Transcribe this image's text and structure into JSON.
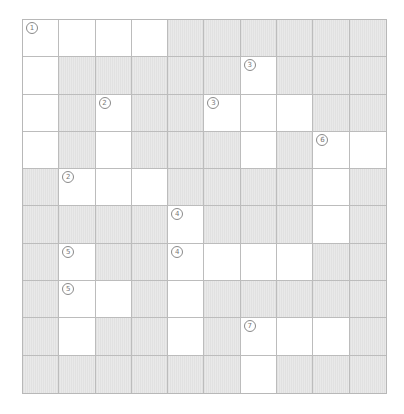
{
  "puzzle": {
    "type": "crossword-grid",
    "rows": 10,
    "cols": 10,
    "colors": {
      "open": "#ffffff",
      "blocked": "#e9e9e9",
      "line": "#bcbcbc",
      "number": "#777777"
    },
    "layout": [
      "WWWWGGGGGG",
      "WGGGGGWGGG",
      "WGWGGWWWGG",
      "WGWGGGWGWW",
      "GWWWGGGGWG",
      "GGGGWGGGWG",
      "GWGGWWWWGG",
      "GWWGWGGGGG",
      "GWGGWGWWWG",
      "GGGGGGWGGG"
    ],
    "clue_numbers": [
      {
        "row": 0,
        "col": 0,
        "label": "①"
      },
      {
        "row": 1,
        "col": 6,
        "label": "③"
      },
      {
        "row": 2,
        "col": 2,
        "label": "②"
      },
      {
        "row": 2,
        "col": 5,
        "label": "③"
      },
      {
        "row": 3,
        "col": 8,
        "label": "⑥"
      },
      {
        "row": 4,
        "col": 1,
        "label": "②"
      },
      {
        "row": 5,
        "col": 4,
        "label": "④"
      },
      {
        "row": 6,
        "col": 1,
        "label": "⑤"
      },
      {
        "row": 6,
        "col": 4,
        "label": "④"
      },
      {
        "row": 7,
        "col": 1,
        "label": "⑤"
      },
      {
        "row": 8,
        "col": 6,
        "label": "⑦"
      }
    ]
  }
}
